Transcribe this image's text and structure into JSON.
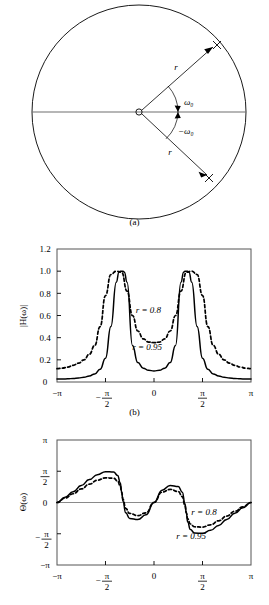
{
  "figure": {
    "panels": [
      {
        "id": "a",
        "caption": "(a)"
      },
      {
        "id": "b",
        "caption": "(b)"
      },
      {
        "id": "c",
        "caption": ""
      }
    ]
  },
  "panel_a": {
    "caption": "(a)",
    "unit_circle_label": "unit-circle",
    "origin_label": "o",
    "pole_marker": "×",
    "radius_label_upper": "r",
    "radius_label_lower": "r",
    "angle_label_upper": "ω₀",
    "angle_label_lower": "−ω₀"
  },
  "chart_data": [
    {
      "id": "b",
      "type": "line",
      "title": "",
      "caption": "(b)",
      "xlabel": "",
      "ylabel": "|H(ω)|",
      "xlim": [
        -3.14159,
        3.14159
      ],
      "ylim": [
        0,
        1.2
      ],
      "grid": false,
      "xticks": [
        -3.14159,
        -1.5708,
        0,
        1.5708,
        3.14159
      ],
      "xticklabels": [
        "−π",
        "−π/2",
        "0",
        "π/2",
        "π"
      ],
      "yticks": [
        0,
        0.2,
        0.4,
        0.6,
        0.8,
        1.0,
        1.2
      ],
      "yticklabels": [
        "0",
        "0.2",
        "0.4",
        "0.6",
        "0.8",
        "1.0",
        "1.2"
      ],
      "resonant_frequency": 1.0472,
      "annotations": [
        {
          "text": "r = 0.8",
          "x": -0.18,
          "y": 0.62
        },
        {
          "text": "r = 0.95",
          "x": -0.22,
          "y": 0.29
        }
      ],
      "series": [
        {
          "name": "r = 0.8",
          "style": "dashed",
          "r": 0.8,
          "x": [
            -3.1416,
            -2.9671,
            -2.7925,
            -2.618,
            -2.4435,
            -2.2689,
            -2.0944,
            -1.9199,
            -1.7453,
            -1.5708,
            -1.3963,
            -1.2217,
            -1.0472,
            -0.8727,
            -0.6981,
            -0.5236,
            -0.3491,
            -0.1745,
            0.0,
            0.1745,
            0.3491,
            0.5236,
            0.6981,
            0.8727,
            1.0472,
            1.2217,
            1.3963,
            1.5708,
            1.7453,
            1.9199,
            2.0944,
            2.2689,
            2.4435,
            2.618,
            2.7925,
            2.9671,
            3.1416
          ],
          "y": [
            0.12,
            0.125,
            0.135,
            0.15,
            0.17,
            0.2,
            0.25,
            0.33,
            0.5,
            0.78,
            0.97,
            1.0,
            0.99,
            0.82,
            0.6,
            0.46,
            0.39,
            0.36,
            0.355,
            0.36,
            0.39,
            0.46,
            0.6,
            0.82,
            0.99,
            1.0,
            0.97,
            0.78,
            0.5,
            0.33,
            0.25,
            0.2,
            0.17,
            0.15,
            0.135,
            0.125,
            0.12
          ]
        },
        {
          "name": "r = 0.95",
          "style": "solid",
          "r": 0.95,
          "x": [
            -3.1416,
            -2.9671,
            -2.7925,
            -2.618,
            -2.4435,
            -2.2689,
            -2.0944,
            -1.9199,
            -1.7453,
            -1.5708,
            -1.3963,
            -1.2217,
            -1.1345,
            -1.0908,
            -1.0472,
            -1.0036,
            -0.9599,
            -0.8727,
            -0.6981,
            -0.5236,
            -0.3491,
            -0.1745,
            0.0,
            0.1745,
            0.3491,
            0.5236,
            0.6981,
            0.8727,
            0.9599,
            1.0036,
            1.0472,
            1.0908,
            1.1345,
            1.2217,
            1.3963,
            1.5708,
            1.7453,
            1.9199,
            2.0944,
            2.2689,
            2.4435,
            2.618,
            2.7925,
            2.9671,
            3.1416
          ],
          "y": [
            0.026,
            0.027,
            0.029,
            0.032,
            0.036,
            0.043,
            0.054,
            0.073,
            0.115,
            0.215,
            0.5,
            0.9,
            0.99,
            1.0,
            1.0,
            1.0,
            0.99,
            0.9,
            0.33,
            0.175,
            0.125,
            0.105,
            0.1,
            0.105,
            0.125,
            0.175,
            0.33,
            0.9,
            0.99,
            1.0,
            1.0,
            1.0,
            0.99,
            0.9,
            0.5,
            0.215,
            0.115,
            0.073,
            0.054,
            0.043,
            0.036,
            0.032,
            0.029,
            0.027,
            0.026
          ]
        }
      ]
    },
    {
      "id": "c",
      "type": "line",
      "title": "",
      "caption": "",
      "xlabel": "",
      "ylabel": "Θ(ω)",
      "xlim": [
        -3.14159,
        3.14159
      ],
      "ylim": [
        -3.14159,
        3.14159
      ],
      "grid": false,
      "xticks": [
        -3.14159,
        -1.5708,
        0,
        1.5708,
        3.14159
      ],
      "xticklabels": [
        "−π",
        "−π/2",
        "0",
        "π/2",
        "π"
      ],
      "yticks": [
        -3.14159,
        -1.5708,
        0,
        1.5708,
        3.14159
      ],
      "yticklabels": [
        "−π",
        "−π/2",
        "0",
        "π/2",
        "π"
      ],
      "annotations": [
        {
          "text": "r = 0.8",
          "x": 1.62,
          "y": -0.62
        },
        {
          "text": "r = 0.95",
          "x": 1.2,
          "y": -1.85
        }
      ],
      "series": [
        {
          "name": "r = 0.8",
          "style": "dashed",
          "r": 0.8,
          "x": [
            -3.1416,
            -2.8798,
            -2.618,
            -2.3562,
            -2.0944,
            -1.8326,
            -1.5708,
            -1.309,
            -1.1781,
            -1.0908,
            -1.0472,
            -1.0036,
            -0.9163,
            -0.7854,
            -0.5236,
            -0.2618,
            0.0,
            0.2618,
            0.5236,
            0.7854,
            0.9163,
            1.0036,
            1.0472,
            1.0908,
            1.1781,
            1.309,
            1.5708,
            1.8326,
            2.0944,
            2.3562,
            2.618,
            2.8798,
            3.1416
          ],
          "y": [
            0.0,
            0.22,
            0.44,
            0.68,
            0.92,
            1.12,
            1.24,
            1.22,
            1.08,
            0.82,
            0.52,
            0.16,
            -0.3,
            -0.55,
            -0.66,
            -0.52,
            0.0,
            0.52,
            0.66,
            0.55,
            0.3,
            -0.16,
            -0.52,
            -0.82,
            -1.08,
            -1.22,
            -1.24,
            -1.12,
            -0.92,
            -0.68,
            -0.44,
            -0.22,
            0.0
          ]
        },
        {
          "name": "r = 0.95",
          "style": "solid",
          "r": 0.95,
          "x": [
            -3.1416,
            -2.8798,
            -2.618,
            -2.3562,
            -2.0944,
            -1.8326,
            -1.5708,
            -1.309,
            -1.1781,
            -1.0908,
            -1.0472,
            -1.0036,
            -0.9163,
            -0.7854,
            -0.5236,
            -0.2618,
            0.0,
            0.2618,
            0.5236,
            0.7854,
            0.9163,
            1.0036,
            1.0472,
            1.0908,
            1.1781,
            1.309,
            1.5708,
            1.8326,
            2.0944,
            2.3562,
            2.618,
            2.8798,
            3.1416
          ],
          "y": [
            0.0,
            0.26,
            0.54,
            0.85,
            1.15,
            1.4,
            1.55,
            1.53,
            1.36,
            0.98,
            0.52,
            0.06,
            -0.52,
            -0.8,
            -0.86,
            -0.62,
            0.0,
            0.62,
            0.86,
            0.8,
            0.52,
            -0.06,
            -0.52,
            -0.98,
            -1.36,
            -1.53,
            -1.55,
            -1.4,
            -1.15,
            -0.85,
            -0.54,
            -0.26,
            0.0
          ]
        }
      ]
    }
  ]
}
